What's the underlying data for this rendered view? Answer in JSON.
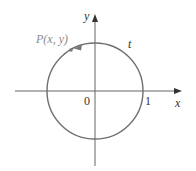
{
  "diagram": {
    "type": "unit-circle",
    "labels": {
      "point": "P(x, y)",
      "arc": "t",
      "origin": "0",
      "one": "1",
      "x_axis": "x",
      "y_axis": "y"
    },
    "colors": {
      "axis": "#555555",
      "circle": "#6f6f6f",
      "point_label": "#8a8a8a",
      "text": "#333333"
    },
    "geometry": {
      "center": [
        95,
        91
      ],
      "radius": 48,
      "point": [
        71,
        50
      ]
    }
  }
}
